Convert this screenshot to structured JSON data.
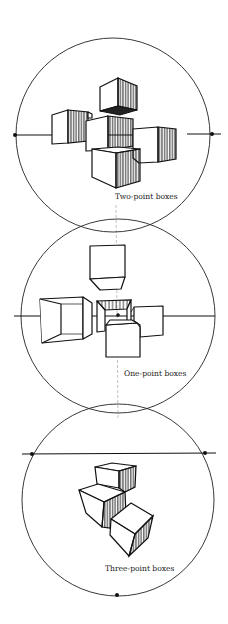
{
  "figure": {
    "panels": [
      {
        "id": "two-point",
        "caption": "Two-point boxes",
        "circle": {
          "cx": 113,
          "cy": 135,
          "r": 97
        },
        "horizon_y": 135,
        "vanishing_points": [
          {
            "x": 15,
            "y": 135
          },
          {
            "x": 212,
            "y": 134
          }
        ],
        "box_count": 5
      },
      {
        "id": "one-point",
        "caption": "One-point boxes",
        "circle": {
          "cx": 118,
          "cy": 316,
          "r": 97
        },
        "horizon_y": 316,
        "vanishing_points": [
          {
            "x": 118,
            "y": 315
          }
        ],
        "box_count": 5
      },
      {
        "id": "three-point",
        "caption": "Three-point boxes",
        "circle": {
          "cx": 118,
          "cy": 500,
          "r": 96
        },
        "horizon_y": 454,
        "vanishing_points": [
          {
            "x": 32,
            "y": 454
          },
          {
            "x": 205,
            "y": 453
          },
          {
            "x": 117,
            "y": 595
          }
        ],
        "box_count": 3
      }
    ],
    "colors": {
      "ink": "#111111",
      "background": "#ffffff",
      "guide": "#999999"
    }
  }
}
